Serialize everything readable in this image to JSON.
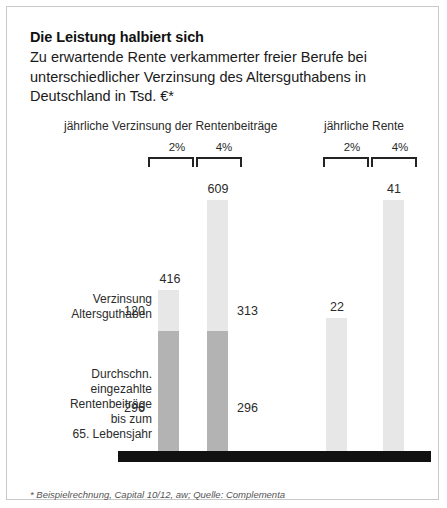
{
  "headline": "Die Leistung halbiert sich",
  "subhead": "Zu erwartende Rente verkammerter freier Berufe bei unterschiedlicher Verzinsung des Altersguthabens in Deutschland in Tsd. €*",
  "groups": {
    "left_caption": "jährliche Verzinsung der Rentenbeiträge",
    "right_caption": "jährliche Rente",
    "rate_low": "2%",
    "rate_high": "4%"
  },
  "side_labels": {
    "interest": "Verzinsung\nAltersguthaben",
    "contributions": "Durchschn.\neingezahlte\nRentenbeiträge\nbis zum\n65. Lebensjahr"
  },
  "bar_labels": {
    "left_1_total": "416",
    "left_1_top": "120",
    "left_1_base": "296",
    "left_2_total": "609",
    "left_2_top": "313",
    "left_2_base": "296",
    "right_1_total": "22",
    "right_2_total": "41"
  },
  "footnote": "* Beispielrechnung, Capital 10/12, aw; Quelle: Complementa",
  "colors": {
    "segment_top": "#e7e7e7",
    "segment_base": "#b3b3b3",
    "baseline": "#111111",
    "text": "#2b2b2b",
    "frame": "#c9c9c9"
  },
  "chart_data": {
    "type": "bar",
    "title": "Die Leistung halbiert sich",
    "subtitle": "Zu erwartende Rente verkammerter freier Berufe bei unterschiedlicher Verzinsung des Altersguthabens in Deutschland in Tsd. €*",
    "xlabel": "",
    "ylabel": "Tsd. €",
    "grid": false,
    "legend_position": "none",
    "groups": [
      {
        "name": "jährliche Verzinsung der Rentenbeiträge",
        "categories": [
          "2%",
          "4%"
        ],
        "stacked": true,
        "series": [
          {
            "name": "Durchschn. eingezahlte Rentenbeiträge bis zum 65. Lebensjahr",
            "values": [
              296,
              296
            ]
          },
          {
            "name": "Verzinsung Altersguthaben",
            "values": [
              120,
              313
            ]
          }
        ],
        "totals": [
          416,
          609
        ]
      },
      {
        "name": "jährliche Rente",
        "categories": [
          "2%",
          "4%"
        ],
        "stacked": false,
        "series": [
          {
            "name": "jährliche Rente",
            "values": [
              22,
              41
            ]
          }
        ],
        "totals": [
          22,
          41
        ]
      }
    ],
    "annotations": [
      "* Beispielrechnung, Capital 10/12, aw; Quelle: Complementa"
    ]
  }
}
